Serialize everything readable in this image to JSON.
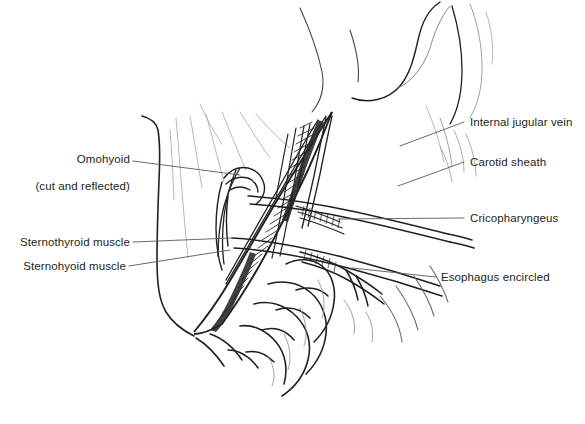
{
  "figure": {
    "style": "pen-and-ink line drawing",
    "background_color": "#ffffff",
    "ink_color": "#231f20",
    "leader_line_color": "#58595b",
    "width": 585,
    "height": 424
  },
  "labels": {
    "omohyoid": {
      "line1": "Omohyoid",
      "line2": "(cut and reflected)",
      "side": "left"
    },
    "sternothyroid": {
      "text": "Sternothyroid muscle",
      "side": "left"
    },
    "sternohyoid": {
      "text": "Sternohyoid muscle",
      "side": "left"
    },
    "internal_jugular_vein": {
      "text": "Internal jugular vein",
      "side": "right"
    },
    "carotid_sheath": {
      "text": "Carotid sheath",
      "side": "right"
    },
    "cricopharyngeus": {
      "text": "Cricopharyngeus",
      "side": "right"
    },
    "esophagus_encircled": {
      "text": "Esophagus encircled",
      "side": "right"
    }
  }
}
